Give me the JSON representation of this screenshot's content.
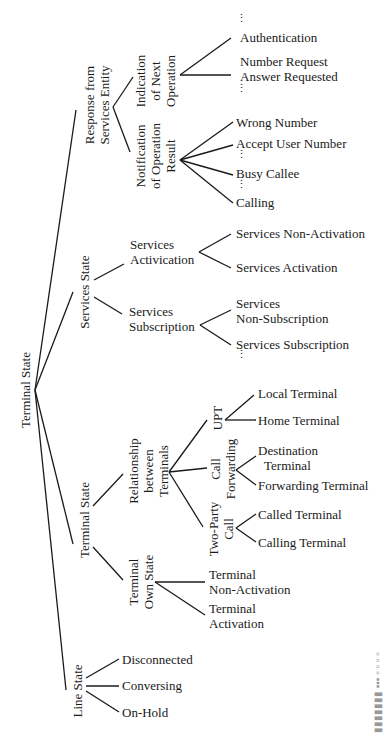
{
  "diagram": {
    "type": "tree",
    "orientation": "rotated-left-to-right",
    "root": "Terminal State",
    "branches": {
      "response": {
        "label": "Response from Services Entity",
        "line1": "Response from",
        "line2": "Services Entity",
        "children": {
          "next_op": {
            "line1": "Indication",
            "line2": "of Next",
            "line3": "Operation",
            "items": [
              "Authentication",
              "Number Request",
              "Answer Requested"
            ]
          },
          "notification": {
            "line1": "Notification",
            "line2": "of Operation",
            "line3": "Result",
            "items": [
              "Wrong Number",
              "Accept User Number",
              "Busy Callee",
              "Calling"
            ]
          }
        }
      },
      "services_state": {
        "label": "Services State",
        "children": {
          "activation": {
            "line1": "Services",
            "line2": "Activication",
            "items": [
              "Services Non-Activation",
              "Services Activation"
            ]
          },
          "subscription": {
            "line1": "Services",
            "line2": "Subscription",
            "items": [
              "Services",
              "Non-Subscription",
              "Services Subscription"
            ]
          }
        }
      },
      "terminal_state": {
        "label": "Terminal State",
        "children": {
          "relationship": {
            "line1": "Relationship",
            "line2": "between",
            "line3": "Terminals",
            "upt": {
              "label": "UPT",
              "items": [
                "Local Terminal",
                "Home Terminal"
              ]
            },
            "call_forwarding": {
              "line1": "Call",
              "line2": "Forwarding",
              "items": [
                "Destination",
                "Terminal",
                "Forwarding Terminal"
              ]
            },
            "two_party": {
              "line1": "Two-Party",
              "line2": "Call",
              "items": [
                "Called Terminal",
                "Calling Terminal"
              ]
            }
          },
          "own_state": {
            "line1": "Terminal",
            "line2": "Own State",
            "items": [
              "Terminal",
              "Non-Activation",
              "Terminal",
              "Activation"
            ]
          }
        }
      },
      "line_state": {
        "label": "Line State",
        "items": [
          "Disconnected",
          "Conversing",
          "On-Hold"
        ]
      }
    },
    "ellipsis": "⋮"
  }
}
